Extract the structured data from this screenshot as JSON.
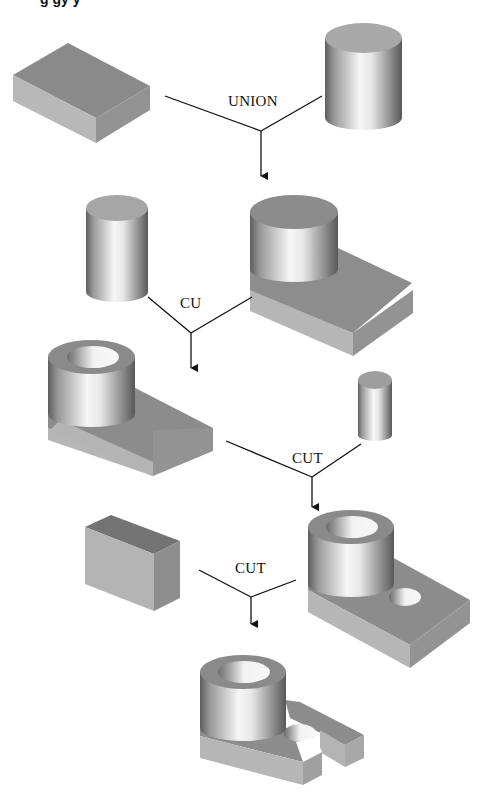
{
  "diagram": {
    "type": "CSG construction tree",
    "clipped_heading": "g      gy                        y",
    "colors": {
      "top_face": "#8c8c8c",
      "front_face": "#b4b4b4",
      "side_face": "#8a8a8a",
      "cyl_dark": "#5a5a5a",
      "cyl_light": "#f4f4f4",
      "line": "#111111"
    },
    "steps": [
      {
        "id": "step1",
        "operation": "UNION",
        "left_operand": "rectangular block",
        "right_operand": "cylinder",
        "result": "cylinder on block"
      },
      {
        "id": "step2",
        "operation": "CU",
        "left_operand": "cylinder",
        "right_operand": "cylinder on block",
        "result": "hollow boss on block"
      },
      {
        "id": "step3",
        "operation": "CUT",
        "left_operand": "hollow boss on block",
        "right_operand": "small cylinder",
        "result": "boss on block with through hole"
      },
      {
        "id": "step4",
        "operation": "CUT",
        "left_operand": "rectangular block",
        "right_operand": "boss on block with through hole",
        "result": "forked bracket with slot"
      }
    ]
  }
}
